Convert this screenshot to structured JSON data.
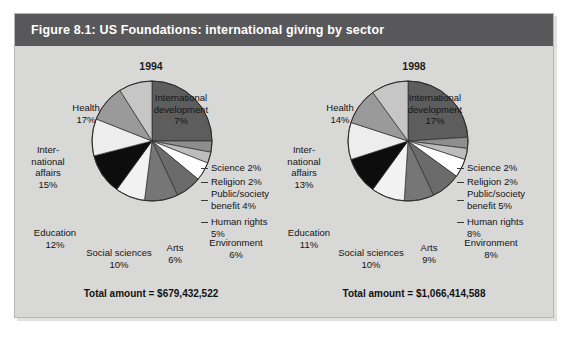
{
  "figure": {
    "header": "Figure 8.1: US Foundations: international giving by sector"
  },
  "charts": [
    {
      "year": "1994",
      "total": "Total amount = $679,432,522",
      "labels": {
        "international_development": "International\ndevelopment\n7%",
        "science": "Science 2%",
        "religion": "Religion 2%",
        "public_society": "Public/society\nbenefit 4%",
        "human_rights": "Human rights\n5%",
        "environment": "Environment\n6%",
        "arts": "Arts\n6%",
        "social_sciences": "Social sciences\n10%",
        "education": "Education\n12%",
        "international_affairs": "Inter-\nnational\naffairs\n15%",
        "health": "Health\n17%"
      }
    },
    {
      "year": "1998",
      "total": "Total amount = $1,066,414,588",
      "labels": {
        "international_development": "International\ndevelopment\n17%",
        "science": "Science 2%",
        "religion": "Religion 2%",
        "public_society": "Public/society\nbenefit 5%",
        "human_rights": "Human rights\n8%",
        "environment": "Environment\n8%",
        "arts": "Arts\n9%",
        "social_sciences": "Social sciences\n10%",
        "education": "Education\n11%",
        "international_affairs": "Inter-\nnational\naffairs\n13%",
        "health": "Health\n14%"
      }
    }
  ],
  "chart_data": [
    {
      "type": "pie",
      "title": "1994",
      "categories": [
        "International development",
        "Science",
        "Religion",
        "Public/society benefit",
        "Human rights",
        "Environment",
        "Arts",
        "Social sciences",
        "Education",
        "International affairs",
        "Health"
      ],
      "values": [
        7,
        2,
        2,
        4,
        5,
        6,
        6,
        10,
        12,
        15,
        17
      ],
      "unit": "%",
      "total_label": "Total amount = $679,432,522",
      "total_value": 679432522,
      "currency": "USD",
      "colors": [
        "#5d5d5d",
        "#8e8e8e",
        "#bdbdbd",
        "#ffffff",
        "#6b6b6b",
        "#767676",
        "#f2f2f2",
        "#0d0d0d",
        "#ededed",
        "#9a9a9a",
        "#c6c6c6"
      ],
      "start_angle_deg": 0,
      "direction": "clockwise",
      "legend": "none",
      "grid": false
    },
    {
      "type": "pie",
      "title": "1998",
      "categories": [
        "International development",
        "Science",
        "Religion",
        "Public/society benefit",
        "Human rights",
        "Environment",
        "Arts",
        "Social sciences",
        "Education",
        "International affairs",
        "Health"
      ],
      "values": [
        17,
        2,
        2,
        5,
        8,
        8,
        9,
        10,
        11,
        13,
        14
      ],
      "unit": "%",
      "total_label": "Total amount = $1,066,414,588",
      "total_value": 1066414588,
      "currency": "USD",
      "colors": [
        "#5d5d5d",
        "#8e8e8e",
        "#bdbdbd",
        "#ffffff",
        "#6b6b6b",
        "#767676",
        "#f2f2f2",
        "#0d0d0d",
        "#ededed",
        "#9a9a9a",
        "#c6c6c6"
      ],
      "start_angle_deg": 0,
      "direction": "clockwise",
      "legend": "none",
      "grid": false
    }
  ]
}
